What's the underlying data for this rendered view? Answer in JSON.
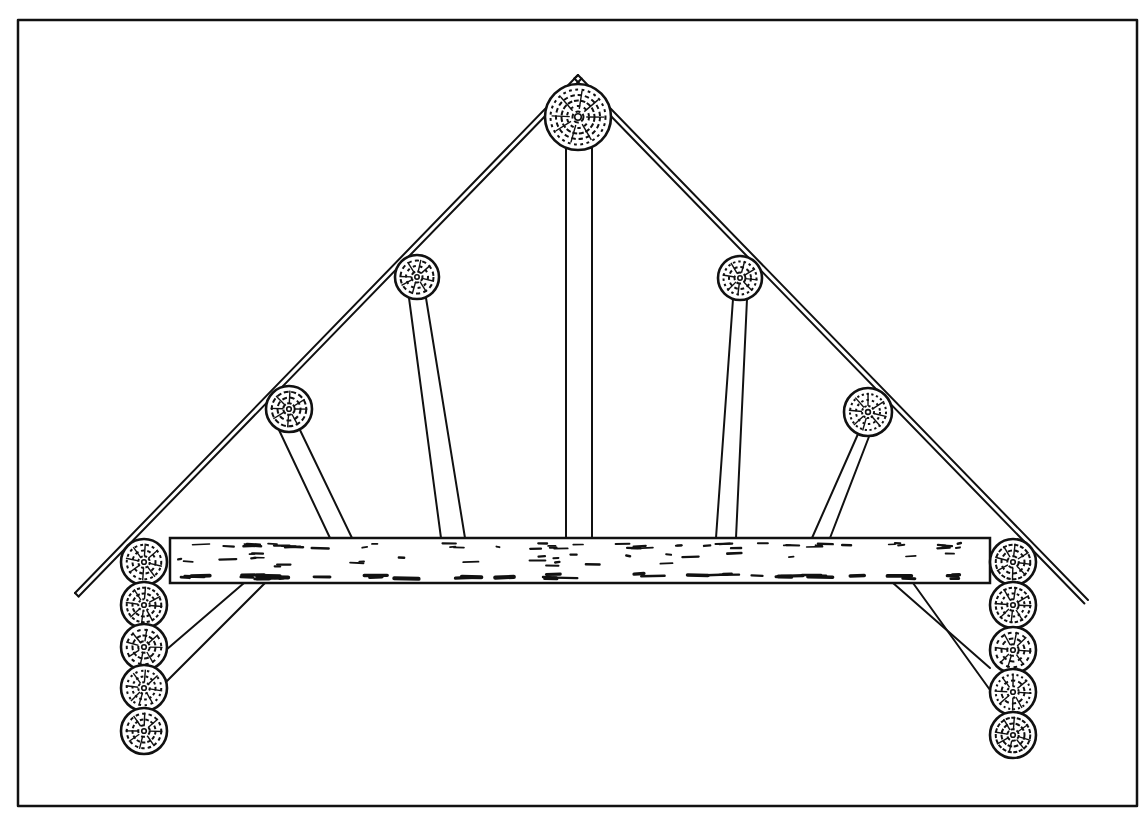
{
  "diagram": {
    "colors": {
      "ink": "#111111",
      "paper": "#ffffff"
    },
    "frame": {
      "x": 18,
      "y": 20,
      "w": 1119,
      "h": 786,
      "stroke": 2.5
    },
    "rafters": {
      "left": {
        "x1": 75,
        "y1": 593,
        "x2": 578,
        "y2": 75
      },
      "right": {
        "x1": 578,
        "y1": 75,
        "x2": 1088,
        "y2": 600
      },
      "gap": 5
    },
    "ridge_log": {
      "cx": 578,
      "cy": 117,
      "r": 33
    },
    "purlins": [
      {
        "name": "left-lower-purlin",
        "cx": 289,
        "cy": 409,
        "r": 23
      },
      {
        "name": "left-upper-purlin",
        "cx": 417,
        "cy": 277,
        "r": 22
      },
      {
        "name": "right-upper-purlin",
        "cx": 740,
        "cy": 278,
        "r": 22
      },
      {
        "name": "right-lower-purlin",
        "cx": 868,
        "cy": 412,
        "r": 24
      }
    ],
    "king_post": {
      "x1": 566,
      "x2": 592,
      "top": 148,
      "bottom": 538
    },
    "struts": [
      {
        "name": "left-lower-strut",
        "top": [
          [
            279,
            430
          ],
          [
            299,
            428
          ]
        ],
        "bottom": [
          [
            330,
            538
          ],
          [
            352,
            538
          ]
        ]
      },
      {
        "name": "left-upper-strut",
        "top": [
          [
            409,
            298
          ],
          [
            426,
            298
          ]
        ],
        "bottom": [
          [
            441,
            538
          ],
          [
            465,
            538
          ]
        ]
      },
      {
        "name": "right-upper-strut",
        "top": [
          [
            733,
            299
          ],
          [
            747,
            299
          ]
        ],
        "bottom": [
          [
            716,
            538
          ],
          [
            736,
            538
          ]
        ]
      },
      {
        "name": "right-lower-strut",
        "top": [
          [
            858,
            434
          ],
          [
            870,
            434
          ]
        ],
        "bottom": [
          [
            812,
            538
          ],
          [
            830,
            538
          ]
        ]
      }
    ],
    "tie_beam": {
      "x1": 170,
      "x2": 990,
      "y1": 538,
      "y2": 583
    },
    "wall_logs": {
      "left": {
        "cx": 144,
        "r": 23,
        "cy": [
          562,
          605,
          647,
          688,
          731
        ]
      },
      "right": {
        "cx": 1013,
        "r": 23,
        "cy": [
          562,
          605,
          650,
          692,
          735
        ]
      }
    },
    "knee_braces": [
      {
        "name": "left-knee-brace",
        "a": [
          [
            244,
            583
          ],
          [
            265,
            583
          ]
        ],
        "b": [
          [
            166,
            650
          ],
          [
            166,
            682
          ]
        ]
      },
      {
        "name": "right-knee-brace",
        "a": [
          [
            893,
            583
          ],
          [
            913,
            583
          ]
        ],
        "b": [
          [
            990,
            668
          ],
          [
            990,
            690
          ]
        ]
      }
    ],
    "caption": ""
  }
}
